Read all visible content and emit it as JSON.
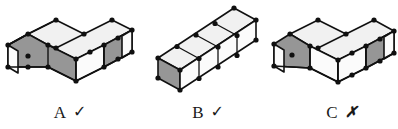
{
  "figure": {
    "colors": {
      "top_face": "#f1f1f1",
      "left_face": "#969696",
      "right_face": "#fbfbfb",
      "edge": "#111111",
      "vertex_dot": "#101010",
      "background": "#ffffff",
      "text": "#1a1a1a"
    },
    "shapes": [
      {
        "id": "A",
        "name": "shape-a",
        "label": "A",
        "mark": "✓",
        "mark_name": "check-mark",
        "verdict": "correct",
        "description": "S/Z-shaped block assembly, 4 unit cubes, top faces light, left faces shaded"
      },
      {
        "id": "B",
        "name": "shape-b",
        "label": "B",
        "mark": "✓",
        "mark_name": "check-mark",
        "verdict": "correct",
        "description": "Straight bar of 4 unit cubes in isometric view"
      },
      {
        "id": "C",
        "name": "shape-c",
        "label": "C",
        "mark": "✗",
        "mark_name": "cross-mark",
        "verdict": "incorrect",
        "description": "S/Z-shaped block assembly mirrored, 4 unit cubes"
      }
    ]
  }
}
